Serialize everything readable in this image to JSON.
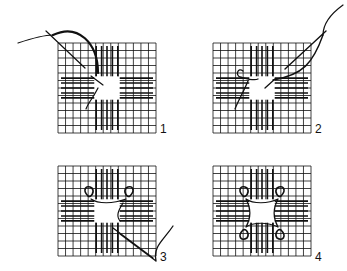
{
  "diagram": {
    "title": "",
    "panels": [
      {
        "step": "1",
        "x": 58,
        "y": 43,
        "label_x": 160,
        "label_y": 122
      },
      {
        "step": "2",
        "x": 213,
        "y": 43,
        "label_x": 315,
        "label_y": 122
      },
      {
        "step": "3",
        "x": 58,
        "y": 166,
        "label_x": 160,
        "label_y": 250
      },
      {
        "step": "4",
        "x": 213,
        "y": 166,
        "label_x": 315,
        "label_y": 250
      }
    ],
    "colors": {
      "ink": "#111111",
      "background": "#ffffff"
    }
  }
}
